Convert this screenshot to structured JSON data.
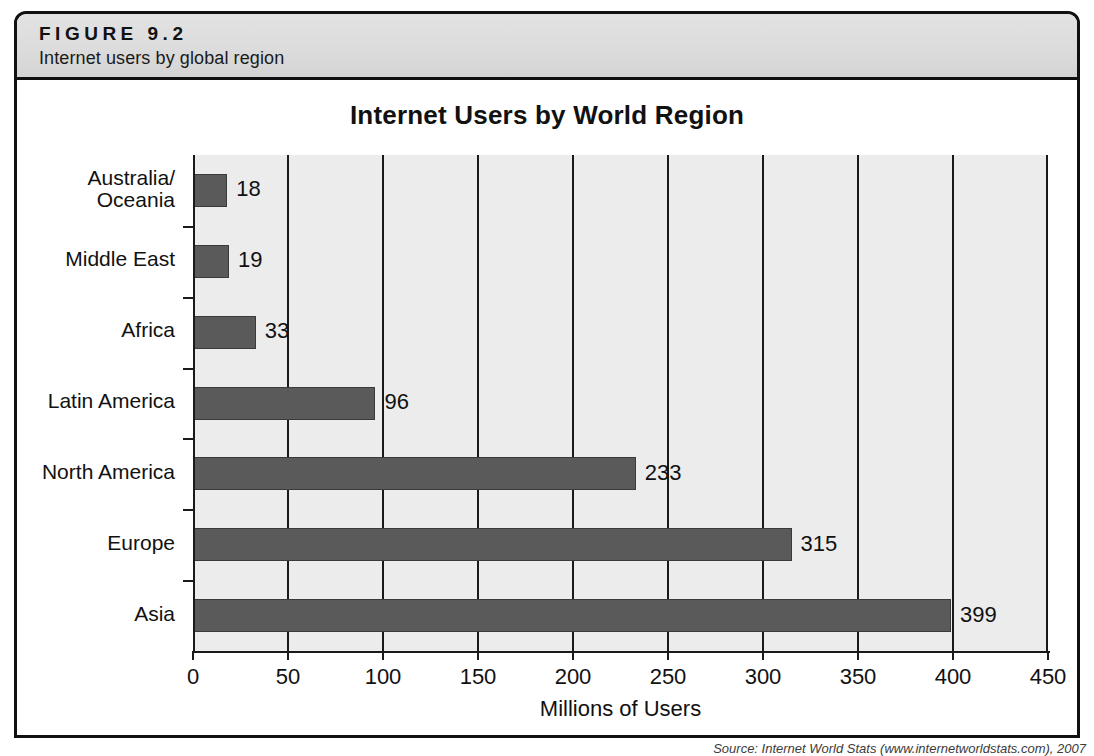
{
  "figure": {
    "number": "FIGURE 9.2",
    "caption": "Internet users by global region"
  },
  "source_note": "Source: Internet World Stats (www.internetworldstats.com), 2007",
  "chart_data": {
    "type": "bar",
    "orientation": "horizontal",
    "title": "Internet Users by World Region",
    "xlabel": "Millions of Users",
    "ylabel": "",
    "categories": [
      "Australia/\nOceania",
      "Middle East",
      "Africa",
      "Latin America",
      "North America",
      "Europe",
      "Asia"
    ],
    "values": [
      18,
      19,
      33,
      96,
      233,
      315,
      399
    ],
    "value_labels": [
      "18",
      "19",
      "33",
      "96",
      "233",
      "315",
      "399"
    ],
    "xlim": [
      0,
      450
    ],
    "xticks": [
      0,
      50,
      100,
      150,
      200,
      250,
      300,
      350,
      400,
      450
    ],
    "xtick_labels": [
      "0",
      "50",
      "100",
      "150",
      "200",
      "250",
      "300",
      "350",
      "400",
      "450"
    ],
    "grid": true,
    "legend": false,
    "colors": {
      "bar": "#5a5a5a",
      "bar_border": "#3a3a3a",
      "plot_background": "#ececec",
      "axis": "#1a1a1a",
      "header_band": "#dcdcdc",
      "text": "#111111"
    }
  }
}
